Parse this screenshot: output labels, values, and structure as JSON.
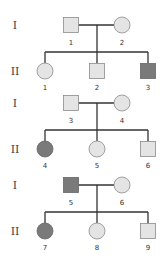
{
  "colors": {
    "unaffected": "#e4e4e4",
    "affected": "#7a7a7a",
    "stroke": "#8a8a8a",
    "line": "#333333"
  },
  "families": [
    {
      "generation_labels": [
        "I",
        "II"
      ],
      "parents": [
        {
          "id": "1",
          "sex": "male",
          "affected": false
        },
        {
          "id": "2",
          "sex": "female",
          "affected": false
        }
      ],
      "children": [
        {
          "id": "1",
          "sex": "female",
          "affected": false
        },
        {
          "id": "2",
          "sex": "male",
          "affected": false
        },
        {
          "id": "3",
          "sex": "male",
          "affected": true
        }
      ]
    },
    {
      "generation_labels": [
        "I",
        "II"
      ],
      "parents": [
        {
          "id": "3",
          "sex": "male",
          "affected": false
        },
        {
          "id": "4",
          "sex": "female",
          "affected": false
        }
      ],
      "children": [
        {
          "id": "4",
          "sex": "female",
          "affected": true
        },
        {
          "id": "5",
          "sex": "female",
          "affected": false
        },
        {
          "id": "6",
          "sex": "male",
          "affected": false
        }
      ]
    },
    {
      "generation_labels": [
        "I",
        "II"
      ],
      "parents": [
        {
          "id": "5",
          "sex": "male",
          "affected": true
        },
        {
          "id": "6",
          "sex": "female",
          "affected": false
        }
      ],
      "children": [
        {
          "id": "7",
          "sex": "female",
          "affected": true
        },
        {
          "id": "8",
          "sex": "female",
          "affected": false
        },
        {
          "id": "9",
          "sex": "male",
          "affected": false
        }
      ]
    }
  ]
}
